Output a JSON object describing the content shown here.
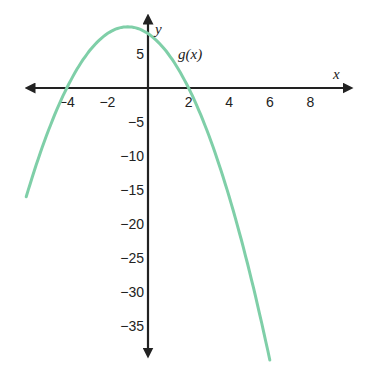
{
  "chart_data": {
    "type": "line",
    "title": "",
    "xlabel": "x",
    "ylabel": "y",
    "xlim": [
      -6,
      10
    ],
    "ylim": [
      -40,
      10
    ],
    "grid": false,
    "x_ticks": [
      -4,
      -2,
      2,
      4,
      6,
      8
    ],
    "x_tick_labels": [
      "−4",
      "−2",
      "2",
      "4",
      "6",
      "8"
    ],
    "y_ticks": [
      5,
      -5,
      -10,
      -15,
      -20,
      -25,
      -30,
      -35
    ],
    "y_tick_labels": [
      "5",
      "−5",
      "−10",
      "−15",
      "−20",
      "−25",
      "−30",
      "−35"
    ],
    "series": [
      {
        "name": "g(x)",
        "color": "#7fcfa8",
        "equation": "g(x) = -x^2 - 2x + 8",
        "x": [
          -6,
          -5,
          -4,
          -3,
          -2,
          -1,
          0,
          1,
          2,
          3,
          4,
          5,
          6
        ],
        "y": [
          -16,
          -7,
          0,
          5,
          8,
          9,
          8,
          5,
          0,
          -7,
          -16,
          -27,
          -40
        ]
      }
    ],
    "annotations": [
      {
        "text": "g(x)",
        "x": 1.6,
        "y": 5
      }
    ]
  },
  "labels": {
    "x_axis": "x",
    "y_axis": "y",
    "function": "g(x)"
  }
}
